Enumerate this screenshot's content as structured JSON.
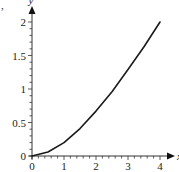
{
  "chart_data": {
    "type": "line",
    "title": "",
    "xlabel": "x",
    "ylabel": "y",
    "xlim": [
      0,
      4
    ],
    "ylim": [
      0,
      2
    ],
    "grid": false,
    "legend": null,
    "x_ticks": [
      "0",
      "1",
      "2",
      "3",
      "4"
    ],
    "y_ticks": [
      "0",
      "0.5",
      "1",
      "1.5",
      "2"
    ],
    "series": [
      {
        "name": "curve",
        "color": "#1a1a1a",
        "x": [
          0,
          0.5,
          1,
          1.5,
          2,
          2.5,
          3,
          3.5,
          4
        ],
        "y": [
          0,
          0.06,
          0.2,
          0.41,
          0.67,
          0.96,
          1.29,
          1.63,
          2.0
        ]
      }
    ]
  },
  "labels": {
    "partial_char": ","
  }
}
